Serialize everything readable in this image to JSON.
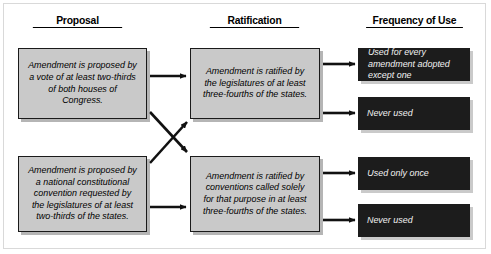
{
  "diagram": {
    "columns": [
      {
        "label": "Proposal",
        "x": 77,
        "y": 14
      },
      {
        "label": "Ratification",
        "x": 254,
        "y": 14
      },
      {
        "label": "Frequency of Use",
        "x": 413,
        "y": 14
      }
    ],
    "proposal_boxes": [
      {
        "id": "proposal-congress",
        "text": "Amendment is proposed by a vote of at least two-thirds of both houses of Congress.",
        "x": 18,
        "y": 48,
        "w": 129,
        "h": 71
      },
      {
        "id": "proposal-convention",
        "text": "Amendment is proposed by a national constitutional convention requested by the legislatures of at least two-thirds of the states.",
        "x": 18,
        "y": 156,
        "w": 129,
        "h": 76
      }
    ],
    "ratification_boxes": [
      {
        "id": "ratification-legislatures",
        "text": "Amendment is ratified by the legislatures of at least three-fourths of the states.",
        "x": 190,
        "y": 48,
        "w": 130,
        "h": 71
      },
      {
        "id": "ratification-conventions",
        "text": "Amendment is ratified by conventions called solely for that purpose in at least three-fourths of the states.",
        "x": 190,
        "y": 156,
        "w": 130,
        "h": 76
      }
    ],
    "frequency_boxes": [
      {
        "id": "frequency-every-amendment",
        "text": "Used for every amendment adopted except one",
        "x": 358,
        "y": 48,
        "w": 112,
        "h": 33
      },
      {
        "id": "frequency-never-used-top",
        "text": "Never used",
        "x": 358,
        "y": 97,
        "w": 112,
        "h": 33
      },
      {
        "id": "frequency-used-once",
        "text": "Used only once",
        "x": 358,
        "y": 157,
        "w": 112,
        "h": 33
      },
      {
        "id": "frequency-never-used-bottom",
        "text": "Never used",
        "x": 358,
        "y": 204,
        "w": 112,
        "h": 33
      }
    ],
    "colors": {
      "box_fill": "#c9c9c9",
      "box_border": "#1a1a1a",
      "dark_fill": "#1c1c1c",
      "dark_text": "#f2f2f2",
      "arrow": "#111111",
      "frame": "#d9d9d9"
    },
    "connectors": [
      {
        "id": "congress-to-legislatures",
        "kind": "straight",
        "from": "proposal-congress",
        "to": "ratification-legislatures"
      },
      {
        "id": "congress-to-conventions",
        "kind": "diagonal",
        "from": "proposal-congress",
        "to": "ratification-conventions"
      },
      {
        "id": "convention-to-legislatures",
        "kind": "diagonal",
        "from": "proposal-convention",
        "to": "ratification-legislatures"
      },
      {
        "id": "convention-to-conventions",
        "kind": "straight",
        "from": "proposal-convention",
        "to": "ratification-conventions"
      },
      {
        "id": "legislatures-to-every-amendment",
        "kind": "straight",
        "from": "ratification-legislatures",
        "to": "frequency-every-amendment"
      },
      {
        "id": "legislatures-to-never-used",
        "kind": "straight",
        "from": "ratification-legislatures",
        "to": "frequency-never-used-top"
      },
      {
        "id": "conventions-to-used-once",
        "kind": "straight",
        "from": "ratification-conventions",
        "to": "frequency-used-once"
      },
      {
        "id": "conventions-to-never-used",
        "kind": "straight",
        "from": "ratification-conventions",
        "to": "frequency-never-used-bottom"
      }
    ]
  }
}
